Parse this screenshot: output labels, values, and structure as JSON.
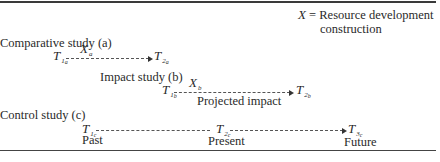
{
  "legend": {
    "symbol": "X",
    "equals": "=",
    "line1": "Resource development",
    "line2": "construction"
  },
  "studies": [
    {
      "title": "Comparative study (a)",
      "start": {
        "symbol": "T",
        "sub": "1",
        "subsub": "a"
      },
      "intervention": {
        "symbol": "X",
        "sub": "a"
      },
      "end": {
        "symbol": "T",
        "sub": "2",
        "subsub": "a"
      }
    },
    {
      "title": "Impact study (b)",
      "start": {
        "symbol": "T",
        "sub": "1",
        "subsub": "b"
      },
      "intervention": {
        "symbol": "X",
        "sub": "b"
      },
      "end": {
        "symbol": "T",
        "sub": "2",
        "subsub": "b"
      },
      "caption": "Projected impact"
    },
    {
      "title": "Control study (c)",
      "points": [
        {
          "symbol": "T",
          "sub": "1",
          "subsub": "c",
          "label": "Past"
        },
        {
          "symbol": "T",
          "sub": "2",
          "subsub": "c",
          "label": "Present"
        },
        {
          "symbol": "T",
          "sub": "3",
          "subsub": "c",
          "label": "Future"
        }
      ]
    }
  ]
}
